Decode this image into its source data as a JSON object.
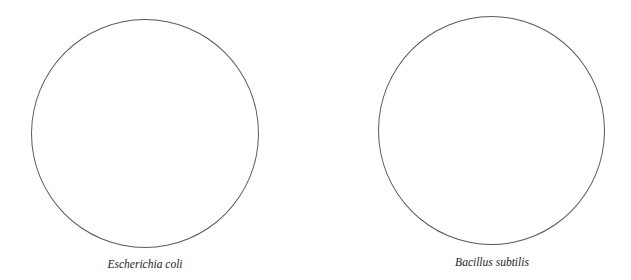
{
  "panels": [
    {
      "label": "Escherichia coli",
      "shape": "circle"
    },
    {
      "label": "Bacillus subtilis",
      "shape": "circle"
    }
  ],
  "colors": {
    "stroke": "#5a5a5a",
    "text": "#222222",
    "background": "#ffffff"
  }
}
